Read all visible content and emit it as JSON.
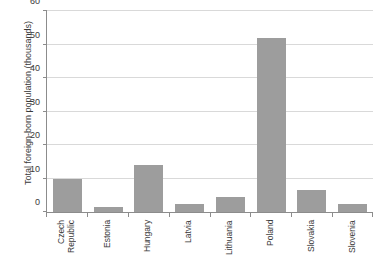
{
  "chart_data": {
    "type": "bar",
    "title": "",
    "xlabel": "",
    "ylabel": "Total foreign-born population (thousands)",
    "categories": [
      "Czech\nRepublic",
      "Estonia",
      "Hungary",
      "Latvia",
      "Lithuania",
      "Poland",
      "Slovakia",
      "Slovenia"
    ],
    "values": [
      10,
      1.5,
      14,
      2.5,
      4.5,
      52,
      6.5,
      2.5
    ],
    "ylim": [
      0,
      60
    ],
    "yticks": [
      0,
      10,
      20,
      30,
      40,
      50,
      60
    ],
    "ytick_labels": [
      "0",
      "10",
      "20",
      "30",
      "40",
      "50",
      "60"
    ],
    "grid": true,
    "legend": "none",
    "bar_color": "#9d9d9d",
    "axis_color": "#8c8c8c",
    "grid_color": "#d9d9d9",
    "text_color": "#3a3a3a"
  }
}
